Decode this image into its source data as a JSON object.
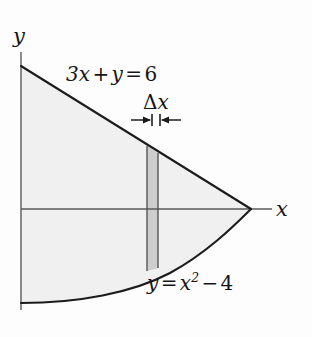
{
  "figure": {
    "background_color": "#fdfdfd",
    "region_fill_color": "#f0f0f0",
    "strip_fill_color": "#cfcfcf",
    "curve_color": "#1a1a1a",
    "axis_color": "#4d4d4d"
  },
  "axes": {
    "y_axis_label": "y",
    "x_axis_label": "x",
    "y_axis": {
      "x": 21,
      "y_top": 52,
      "y_bottom": 310
    },
    "x_axis": {
      "y": 209,
      "x_left": 21,
      "x_right": 272
    }
  },
  "curves": {
    "line": {
      "equation_text_parts": {
        "term1": "3x",
        "plus": "+",
        "term2": "y",
        "equals": "=",
        "value": "6"
      },
      "equation": "3x + y = 6",
      "start_point": {
        "x": 22,
        "y": 66
      },
      "end_point": {
        "x": 250,
        "y": 209
      }
    },
    "parabola": {
      "equation_text_parts": {
        "lhs": "y",
        "equals": "=",
        "base": "x",
        "exponent": "2",
        "minus": "−",
        "value": "4"
      },
      "equation": "y = x² − 4",
      "start_point": {
        "x": 21,
        "y": 303
      },
      "end_point": {
        "x": 250,
        "y": 209
      }
    }
  },
  "strip": {
    "label_delta": "Δ",
    "label_variable": "x",
    "label": "Δx",
    "left_edge_x": 147,
    "right_edge_x": 158,
    "top_y": 146,
    "bottom_y": 272
  },
  "dimension_arrows": {
    "left_arrow_start_x": 131,
    "left_arrow_end_x": 152,
    "right_arrow_start_x": 181,
    "right_arrow_end_x": 160,
    "y": 120
  }
}
